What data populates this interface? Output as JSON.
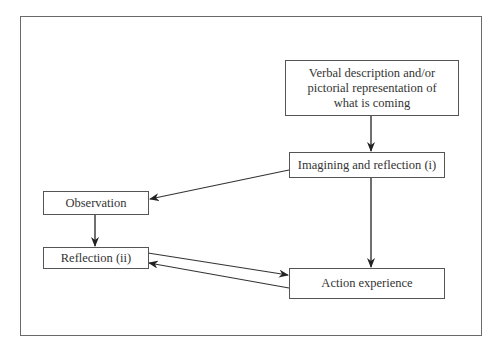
{
  "diagram": {
    "type": "flowchart",
    "nodes": [
      {
        "id": "verbal",
        "label": "Verbal description and/or pictorial representation of what is coming"
      },
      {
        "id": "imagining",
        "label": "Imagining and reflection (i)"
      },
      {
        "id": "observation",
        "label": "Observation"
      },
      {
        "id": "reflection",
        "label": "Reflection (ii)"
      },
      {
        "id": "action",
        "label": "Action experience"
      }
    ],
    "edges": [
      {
        "from": "verbal",
        "to": "imagining"
      },
      {
        "from": "imagining",
        "to": "observation"
      },
      {
        "from": "imagining",
        "to": "action"
      },
      {
        "from": "observation",
        "to": "reflection"
      },
      {
        "from": "reflection",
        "to": "action"
      },
      {
        "from": "action",
        "to": "reflection"
      }
    ]
  },
  "labels": {
    "verbal_l1": "Verbal description and/or",
    "verbal_l2": "pictorial representation of",
    "verbal_l3": "what is coming",
    "imagining": "Imagining and reflection (i)",
    "observation": "Observation",
    "reflection": "Reflection (ii)",
    "action": "Action experience"
  }
}
